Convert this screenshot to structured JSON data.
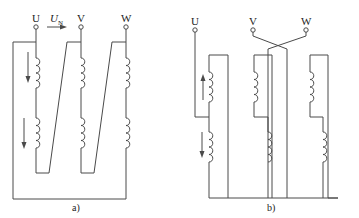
{
  "figure": {
    "stroke_color": "#4a4a4a",
    "background": "#ffffff",
    "a": {
      "caption": "a)",
      "terminals": [
        {
          "label": "U",
          "x": 36
        },
        {
          "label": "V",
          "x": 81
        },
        {
          "label": "W",
          "x": 126
        }
      ],
      "voltage_label": "U",
      "voltage_subscript": "N",
      "arrows": [
        {
          "direction": "down",
          "position": "upper-left"
        },
        {
          "direction": "down",
          "position": "lower-left"
        },
        {
          "direction": "right",
          "position": "between-U-V"
        }
      ]
    },
    "b": {
      "caption": "b)",
      "terminals": [
        {
          "label": "U",
          "x": 195
        },
        {
          "label": "V",
          "x": 253
        },
        {
          "label": "W",
          "x": 306
        }
      ],
      "arrows": [
        {
          "direction": "up",
          "position": "upper-left"
        },
        {
          "direction": "down",
          "position": "lower-left"
        }
      ]
    }
  }
}
